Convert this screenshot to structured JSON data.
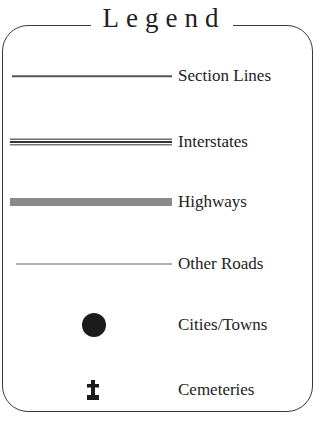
{
  "legend": {
    "title": "Legend",
    "items": [
      {
        "label": "Section Lines",
        "symbol": "thin-line"
      },
      {
        "label": "Interstates",
        "symbol": "triple-line"
      },
      {
        "label": "Highways",
        "symbol": "thick-gray-line"
      },
      {
        "label": "Other Roads",
        "symbol": "hairline"
      },
      {
        "label": "Cities/Towns",
        "symbol": "filled-circle"
      },
      {
        "label": "Cemeteries",
        "symbol": "cross-tombstone"
      }
    ],
    "colors": {
      "border": "#3a3a3a",
      "text": "#222222",
      "highway": "#8a8a8a",
      "city_dot": "#1b1b1b"
    }
  }
}
